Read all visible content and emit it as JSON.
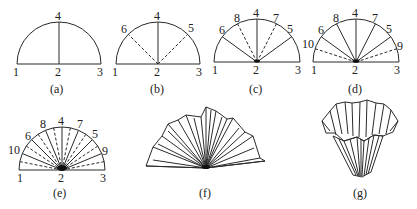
{
  "figure": {
    "panels": [
      {
        "id": "a",
        "caption": "(a)",
        "point_labels": [
          "1",
          "2",
          "3",
          "4"
        ],
        "solid_lines": [
          "2-4"
        ],
        "dashed_lines": []
      },
      {
        "id": "b",
        "caption": "(b)",
        "point_labels": [
          "1",
          "2",
          "3",
          "4",
          "5",
          "6"
        ],
        "solid_lines": [
          "2-4"
        ],
        "dashed_lines": [
          "2-5",
          "2-6"
        ]
      },
      {
        "id": "c",
        "caption": "(c)",
        "point_labels": [
          "1",
          "2",
          "3",
          "4",
          "5",
          "6",
          "7",
          "8"
        ],
        "solid_lines": [
          "2-4",
          "2-5",
          "2-6"
        ],
        "dashed_lines": [
          "2-7",
          "2-8"
        ]
      },
      {
        "id": "d",
        "caption": "(d)",
        "point_labels": [
          "1",
          "2",
          "3",
          "4",
          "5",
          "6",
          "7",
          "8",
          "9",
          "10"
        ],
        "solid_lines": [
          "2-4",
          "2-5",
          "2-6",
          "2-7",
          "2-8"
        ],
        "dashed_lines": [
          "2-9",
          "2-10"
        ]
      },
      {
        "id": "e",
        "caption": "(e)",
        "point_labels": [
          "1",
          "2",
          "3",
          "4",
          "5",
          "6",
          "7",
          "8",
          "9",
          "10"
        ],
        "solid_lines": [
          "all major folds"
        ],
        "dashed_lines": [
          "intermediate folds"
        ]
      },
      {
        "id": "f",
        "caption": "(f)",
        "point_labels": [],
        "note": "pleated fan"
      },
      {
        "id": "g",
        "caption": "(g)",
        "point_labels": [],
        "note": "pleated cup / filter"
      }
    ]
  },
  "labels": {
    "a": {
      "p1": "1",
      "p2": "2",
      "p3": "3",
      "p4": "4",
      "cap": "(a)"
    },
    "b": {
      "p1": "1",
      "p2": "2",
      "p3": "3",
      "p4": "4",
      "p5": "5",
      "p6": "6",
      "cap": "(b)"
    },
    "c": {
      "p1": "1",
      "p2": "2",
      "p3": "3",
      "p4": "4",
      "p5": "5",
      "p6": "6",
      "p7": "7",
      "p8": "8",
      "cap": "(c)"
    },
    "d": {
      "p1": "1",
      "p2": "2",
      "p3": "3",
      "p4": "4",
      "p5": "5",
      "p6": "6",
      "p7": "7",
      "p8": "8",
      "p9": "9",
      "p10": "10",
      "cap": "(d)"
    },
    "e": {
      "p1": "1",
      "p2": "2",
      "p3": "3",
      "p4": "4",
      "p5": "5",
      "p6": "6",
      "p7": "7",
      "p8": "8",
      "p9": "9",
      "p10": "10",
      "cap": "(e)"
    },
    "f": {
      "cap": "(f)"
    },
    "g": {
      "cap": "(g)"
    }
  }
}
